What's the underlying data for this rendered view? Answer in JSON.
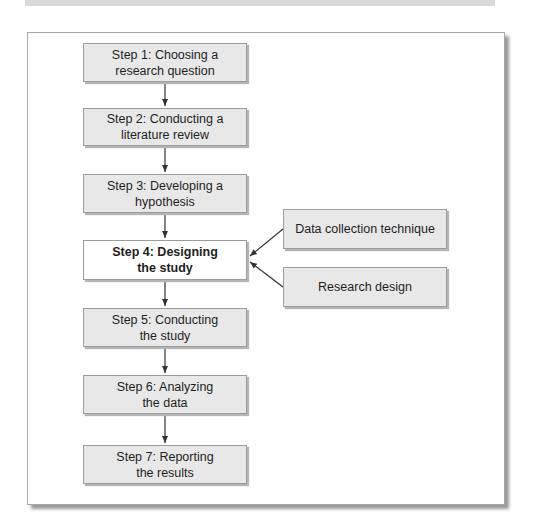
{
  "diagram": {
    "type": "flowchart",
    "steps": [
      {
        "label": "Step 1: Choosing a\nresearch question",
        "highlighted": false
      },
      {
        "label": "Step 2: Conducting a\nliterature review",
        "highlighted": false
      },
      {
        "label": "Step 3: Developing a\nhypothesis",
        "highlighted": false
      },
      {
        "label": "Step 4: Designing\nthe study",
        "highlighted": true
      },
      {
        "label": "Step 5: Conducting\nthe study",
        "highlighted": false
      },
      {
        "label": "Step 6: Analyzing\nthe data",
        "highlighted": false
      },
      {
        "label": "Step 7: Reporting\nthe results",
        "highlighted": false
      }
    ],
    "inputs": [
      {
        "label": "Data collection technique",
        "target_step": 4
      },
      {
        "label": "Research design",
        "target_step": 4
      }
    ],
    "colors": {
      "box_fill": "#e8e8e8",
      "highlight_fill": "#ffffff",
      "border": "#9c9c9c",
      "arrow": "#333333"
    }
  }
}
